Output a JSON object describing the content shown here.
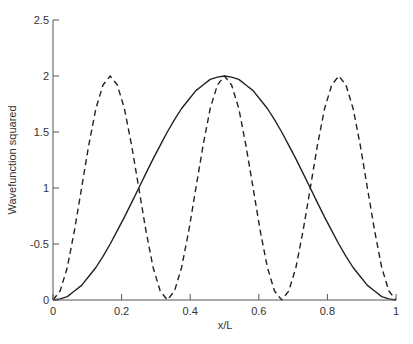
{
  "chart_data": {
    "type": "line",
    "title": "",
    "xlabel": "x/L",
    "ylabel": "Wavefunction squared",
    "xlim": [
      0,
      1
    ],
    "ylim": [
      0,
      2.5
    ],
    "grid": false,
    "legend": null,
    "x_ticks": [
      {
        "value": 0,
        "label": "0"
      },
      {
        "value": 0.2,
        "label": "0.2"
      },
      {
        "value": 0.4,
        "label": "0.4"
      },
      {
        "value": 0.6,
        "label": "0.6"
      },
      {
        "value": 0.8,
        "label": "0.8"
      },
      {
        "value": 1,
        "label": "1"
      }
    ],
    "y_ticks": [
      {
        "value": 0,
        "label": "0"
      },
      {
        "value": 0.5,
        "label": "-0.5"
      },
      {
        "value": 1,
        "label": "1"
      },
      {
        "value": 1.5,
        "label": "1.5"
      },
      {
        "value": 2,
        "label": "2"
      },
      {
        "value": 2.5,
        "label": "2.5"
      }
    ],
    "x": [
      0,
      0.0208,
      0.0417,
      0.0625,
      0.0833,
      0.1042,
      0.125,
      0.1458,
      0.1667,
      0.1875,
      0.2083,
      0.2292,
      0.25,
      0.2708,
      0.2917,
      0.3125,
      0.3333,
      0.3542,
      0.375,
      0.3958,
      0.4167,
      0.4375,
      0.4583,
      0.4792,
      0.5,
      0.5208,
      0.5417,
      0.5625,
      0.5833,
      0.6042,
      0.625,
      0.6458,
      0.6667,
      0.6875,
      0.7083,
      0.7292,
      0.75,
      0.7708,
      0.7917,
      0.8125,
      0.8333,
      0.8542,
      0.875,
      0.8958,
      0.9167,
      0.9375,
      0.9583,
      0.9792,
      1
    ],
    "series": [
      {
        "name": "n=1",
        "style": "solid",
        "color": "#222222",
        "values": [
          0,
          0.01,
          0.03,
          0.08,
          0.13,
          0.21,
          0.29,
          0.39,
          0.5,
          0.62,
          0.74,
          0.87,
          1,
          1.13,
          1.26,
          1.38,
          1.5,
          1.61,
          1.71,
          1.79,
          1.87,
          1.92,
          1.97,
          1.99,
          2,
          1.99,
          1.97,
          1.92,
          1.87,
          1.79,
          1.71,
          1.61,
          1.5,
          1.38,
          1.26,
          1.13,
          1,
          0.87,
          0.74,
          0.62,
          0.5,
          0.39,
          0.29,
          0.21,
          0.13,
          0.08,
          0.03,
          0.01,
          0
        ]
      },
      {
        "name": "n=3",
        "style": "dashed",
        "color": "#222222",
        "values": [
          0,
          0.08,
          0.29,
          0.62,
          1,
          1.38,
          1.71,
          1.92,
          2,
          1.92,
          1.71,
          1.38,
          1,
          0.62,
          0.29,
          0.08,
          0,
          0.08,
          0.29,
          0.62,
          1,
          1.38,
          1.71,
          1.92,
          2,
          1.92,
          1.71,
          1.38,
          1,
          0.62,
          0.29,
          0.08,
          0,
          0.08,
          0.29,
          0.62,
          1,
          1.38,
          1.71,
          1.92,
          2,
          1.92,
          1.71,
          1.38,
          1,
          0.62,
          0.29,
          0.08,
          0
        ]
      }
    ]
  },
  "layout": {
    "plot_left": 53,
    "plot_right": 396,
    "plot_top": 20,
    "plot_bottom": 300
  }
}
